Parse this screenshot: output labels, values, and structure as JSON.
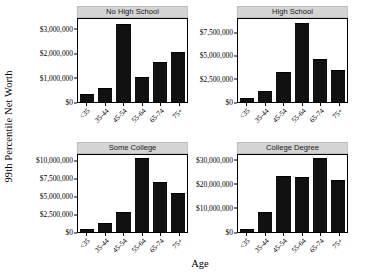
{
  "chart_data": {
    "type": "bar",
    "title": "",
    "xlabel": "Age",
    "ylabel": "99th Percentile Net Worth",
    "grid": false,
    "legend": "none",
    "facet_layout": "2x2",
    "categories": [
      "<35",
      "35-44",
      "45-54",
      "55-64",
      "65-74",
      "75+"
    ],
    "panels": [
      {
        "label": "No High School",
        "values": [
          300000,
          550000,
          3150000,
          980000,
          1600000,
          2000000
        ],
        "ylim": [
          0,
          3400000
        ],
        "yticks": [
          0,
          1000000,
          2000000,
          3000000
        ],
        "yticklabels": [
          "$0",
          "$1,000,000",
          "$2,000,000",
          "$3,000,000"
        ]
      },
      {
        "label": "High School",
        "values": [
          350000,
          1100000,
          3100000,
          8400000,
          4500000,
          3300000
        ],
        "ylim": [
          0,
          8900000
        ],
        "yticks": [
          0,
          2500000,
          5000000,
          7500000
        ],
        "yticklabels": [
          "$0",
          "$2,500,000",
          "$5,000,000",
          "$7,500,000"
        ]
      },
      {
        "label": "Some College",
        "values": [
          300000,
          1100000,
          2600000,
          10100000,
          6800000,
          5300000
        ],
        "ylim": [
          0,
          10700000
        ],
        "yticks": [
          0,
          2500000,
          5000000,
          7500000,
          10000000
        ],
        "yticklabels": [
          "$0",
          "$2,500,000",
          "$5,000,000",
          "$7,500,000",
          "$10,000,000"
        ]
      },
      {
        "label": "College Degree",
        "values": [
          700000,
          8000000,
          23000000,
          22300000,
          30300000,
          21000000
        ],
        "ylim": [
          0,
          32000000
        ],
        "yticks": [
          0,
          10000000,
          20000000,
          30000000
        ],
        "yticklabels": [
          "$0",
          "$10,000,000",
          "$20,000,000",
          "$30,000,000"
        ]
      }
    ],
    "bar_color": "#111111",
    "strip_color": "#d4d4d4"
  }
}
